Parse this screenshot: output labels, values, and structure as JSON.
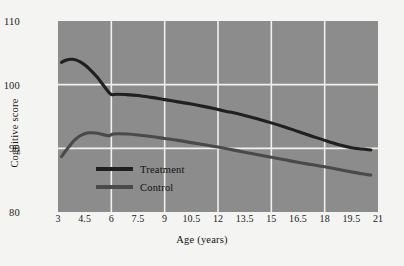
{
  "chart_data": {
    "type": "line",
    "title": "",
    "xlabel": "Age (years)",
    "ylabel": "Cognitive score",
    "xlim": [
      3,
      21
    ],
    "ylim": [
      80,
      110
    ],
    "xticks": [
      "3",
      "4.5",
      "6",
      "7.5",
      "9",
      "10.5",
      "12",
      "13.5",
      "15",
      "16.5",
      "18",
      "19.5",
      "21"
    ],
    "xtick_values": [
      3,
      4.5,
      6,
      7.5,
      9,
      10.5,
      12,
      13.5,
      15,
      16.5,
      18,
      19.5,
      21
    ],
    "yticks": [
      "110",
      "100",
      "90",
      "80"
    ],
    "ytick_values": [
      110,
      100,
      90,
      80
    ],
    "grid": true,
    "grid_x_values": [
      6,
      9,
      12,
      15,
      18
    ],
    "grid_y_values": [
      100,
      90
    ],
    "grid_color": "#f0f0ee",
    "plot_background": "#8c8c8c",
    "figure_background": "#f4f4f2",
    "legend_position": "inside-lower-left",
    "series": [
      {
        "name": "Treatment",
        "color": "#211f1f",
        "x": [
          3.2,
          3.4,
          3.6,
          3.8,
          4.0,
          4.3,
          4.6,
          4.9,
          5.2,
          5.5,
          5.8,
          6.0,
          6.3,
          6.8,
          7.5,
          8.25,
          9.0,
          9.75,
          10.5,
          11.25,
          12.0,
          12.75,
          13.5,
          14.25,
          15.0,
          15.75,
          16.5,
          17.25,
          18.0,
          18.75,
          19.5,
          20.1,
          20.6
        ],
        "y": [
          103.5,
          103.8,
          103.95,
          104.0,
          103.9,
          103.5,
          102.9,
          102.1,
          101.2,
          100.1,
          99.0,
          98.45,
          98.5,
          98.45,
          98.3,
          98.0,
          97.65,
          97.3,
          96.95,
          96.55,
          96.1,
          95.65,
          95.15,
          94.6,
          94.0,
          93.35,
          92.65,
          91.95,
          91.25,
          90.6,
          90.1,
          89.9,
          89.75
        ]
      },
      {
        "name": "Control",
        "color": "#4a4a4a",
        "x": [
          3.2,
          3.4,
          3.6,
          3.9,
          4.2,
          4.5,
          4.8,
          5.1,
          5.4,
          5.7,
          5.9,
          6.1,
          6.4,
          6.9,
          7.5,
          8.25,
          9.0,
          9.75,
          10.5,
          11.25,
          12.0,
          12.75,
          13.5,
          14.25,
          15.0,
          15.75,
          16.5,
          17.25,
          18.0,
          18.75,
          19.5,
          20.1,
          20.6
        ],
        "y": [
          88.7,
          89.5,
          90.2,
          91.2,
          91.9,
          92.3,
          92.45,
          92.4,
          92.25,
          92.05,
          92.0,
          92.25,
          92.3,
          92.25,
          92.1,
          91.85,
          91.55,
          91.25,
          90.9,
          90.55,
          90.2,
          89.8,
          89.4,
          89.0,
          88.6,
          88.2,
          87.8,
          87.45,
          87.1,
          86.7,
          86.3,
          86.0,
          85.8
        ]
      }
    ],
    "annotations": []
  },
  "legend": {
    "items": [
      {
        "label": "Treatment",
        "color": "#211f1f"
      },
      {
        "label": "Control",
        "color": "#4a4a4a"
      }
    ]
  }
}
